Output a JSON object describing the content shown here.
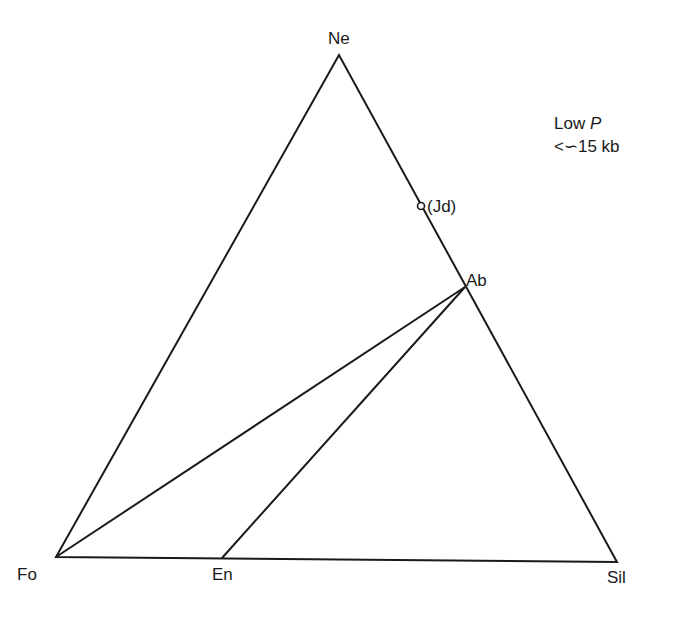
{
  "diagram": {
    "type": "ternary phase diagram",
    "vertices": {
      "top": "Ne",
      "bottom_left": "Fo",
      "bottom_right": "Sil"
    },
    "points": {
      "jadeite": "(Jd)",
      "albite": "Ab",
      "enstatite": "En"
    },
    "tie_lines": [
      {
        "from": "Fo",
        "to": "Ab"
      },
      {
        "from": "En",
        "to": "Ab"
      }
    ],
    "condition": {
      "line1_prefix": "Low ",
      "line1_var": "P",
      "line2": "<∽15 kb"
    },
    "colors": {
      "line": "#1a1a1a",
      "background": "#ffffff"
    }
  }
}
